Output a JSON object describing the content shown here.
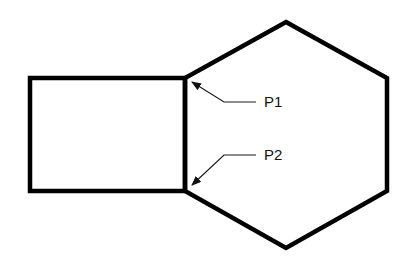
{
  "diagram": {
    "title": "",
    "shapes": [
      {
        "id": "rectangle",
        "type": "rectangle"
      },
      {
        "id": "hexagon",
        "type": "hexagon"
      }
    ],
    "labels": [
      {
        "id": "p1",
        "text": "P1",
        "points_to": "top shared vertex of rectangle and hexagon"
      },
      {
        "id": "p2",
        "text": "P2",
        "points_to": "bottom shared vertex of rectangle and hexagon"
      }
    ],
    "colors": {
      "stroke": "#000000",
      "background": "#ffffff"
    }
  }
}
